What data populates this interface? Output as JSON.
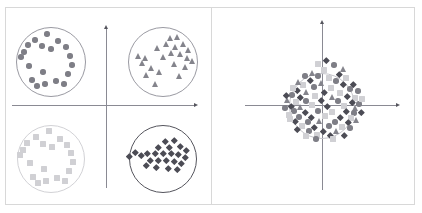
{
  "figure": {
    "title": "",
    "panel_count": 2,
    "background": "#ffffff",
    "frame_color": "#d8d8d8",
    "divider_color": "#d8d8d8",
    "axis_color": "#8a8a93",
    "arrow_color": "#55555d"
  },
  "palette": {
    "circle": "#7e7e86",
    "triangle": "#84848c",
    "square": "#d0d0d4",
    "diamond": "#4c4c55",
    "ring_dark": "#9a9aa2",
    "ring_light": "#d2d2d6"
  },
  "chart_data": {
    "type": "scatter",
    "title": "",
    "xlabel": "",
    "ylabel": "",
    "grid": false,
    "legend": "none",
    "xlim": [
      -1,
      1
    ],
    "ylim": [
      -1,
      1
    ],
    "panels": [
      {
        "name": "separated-clusters",
        "position": "left",
        "axes": {
          "origin_x": 106,
          "origin_y": 105,
          "x_axis_from": 12,
          "x_axis_to": 196,
          "y_axis_from": 188,
          "y_axis_to": 27,
          "x_arrow": "right",
          "y_arrow": "up"
        },
        "clusters": [
          {
            "name": "circles-upper-left",
            "marker": "circle",
            "color": "#7e7e86",
            "ring": {
              "cx": 51,
              "cy": 62,
              "r": 35,
              "color": "#9a9aa2"
            },
            "quadrant": "upper-left",
            "n": 19,
            "points": [
              [
                47,
                34
              ],
              [
                35,
                40
              ],
              [
                58,
                41
              ],
              [
                28,
                45
              ],
              [
                42,
                46
              ],
              [
                24,
                52
              ],
              [
                51,
                49
              ],
              [
                66,
                47
              ],
              [
                21,
                57
              ],
              [
                70,
                56
              ],
              [
                29,
                66
              ],
              [
                72,
                65
              ],
              [
                43,
                72
              ],
              [
                68,
                74
              ],
              [
                32,
                80
              ],
              [
                56,
                81
              ],
              [
                45,
                84
              ],
              [
                64,
                84
              ],
              [
                37,
                86
              ]
            ]
          },
          {
            "name": "triangles-upper-right",
            "marker": "triangle",
            "color": "#84848c",
            "ring": {
              "cx": 163,
              "cy": 62,
              "r": 35,
              "color": "#9a9aa2"
            },
            "quadrant": "upper-right",
            "n": 22,
            "points": [
              [
                171,
                38
              ],
              [
                178,
                37
              ],
              [
                167,
                44
              ],
              [
                184,
                44
              ],
              [
                176,
                47
              ],
              [
                158,
                48
              ],
              [
                189,
                50
              ],
              [
                172,
                53
              ],
              [
                181,
                54
              ],
              [
                139,
                56
              ],
              [
                146,
                58
              ],
              [
                164,
                57
              ],
              [
                188,
                58
              ],
              [
                193,
                61
              ],
              [
                143,
                63
              ],
              [
                175,
                64
              ],
              [
                152,
                68
              ],
              [
                186,
                67
              ],
              [
                160,
                72
              ],
              [
                147,
                75
              ],
              [
                180,
                76
              ],
              [
                156,
                84
              ]
            ]
          },
          {
            "name": "squares-lower-left",
            "marker": "square",
            "color": "#d0d0d4",
            "ring": {
              "cx": 51,
              "cy": 159,
              "r": 34,
              "color": "#d2d2d6"
            },
            "quadrant": "lower-left",
            "n": 19,
            "points": [
              [
                49,
                131
              ],
              [
                36,
                137
              ],
              [
                60,
                139
              ],
              [
                27,
                143
              ],
              [
                43,
                144
              ],
              [
                23,
                150
              ],
              [
                52,
                147
              ],
              [
                67,
                145
              ],
              [
                20,
                155
              ],
              [
                71,
                153
              ],
              [
                30,
                163
              ],
              [
                73,
                162
              ],
              [
                44,
                169
              ],
              [
                69,
                171
              ],
              [
                33,
                177
              ],
              [
                57,
                178
              ],
              [
                46,
                181
              ],
              [
                65,
                181
              ],
              [
                38,
                183
              ]
            ]
          },
          {
            "name": "diamonds-lower-right",
            "marker": "diamond",
            "color": "#4c4c55",
            "ring": {
              "cx": 163,
              "cy": 159,
              "r": 34,
              "color": "#55555d"
            },
            "quadrant": "lower-right",
            "n": 24,
            "points": [
              [
                165,
                141
              ],
              [
                174,
                140
              ],
              [
                158,
                147
              ],
              [
                169,
                147
              ],
              [
                180,
                146
              ],
              [
                186,
                150
              ],
              [
                147,
                153
              ],
              [
                155,
                153
              ],
              [
                163,
                153
              ],
              [
                171,
                153
              ],
              [
                178,
                154
              ],
              [
                185,
                157
              ],
              [
                135,
                152
              ],
              [
                141,
                155
              ],
              [
                129,
                156
              ],
              [
                150,
                160
              ],
              [
                158,
                160
              ],
              [
                166,
                160
              ],
              [
                174,
                161
              ],
              [
                181,
                163
              ],
              [
                146,
                165
              ],
              [
                156,
                167
              ],
              [
                168,
                168
              ],
              [
                177,
                169
              ]
            ]
          }
        ]
      },
      {
        "name": "merged-cluster",
        "position": "right",
        "axes": {
          "origin_x": 322,
          "origin_y": 105,
          "x_axis_from": 245,
          "x_axis_to": 398,
          "y_axis_from": 190,
          "y_axis_to": 22,
          "x_arrow": "right",
          "y_arrow": "up"
        },
        "clusters": [
          {
            "name": "merged-all-shapes",
            "marker": "mixed",
            "ring": {
              "cx": 322,
              "cy": 106,
              "r": 33,
              "color": "#c4c4ca"
            },
            "quadrant": "centered-on-origin",
            "n": 84,
            "points": [
              [
                318,
                76,
                "circle"
              ],
              [
                329,
                78,
                "square"
              ],
              [
                310,
                80,
                "diamond"
              ],
              [
                336,
                81,
                "circle"
              ],
              [
                322,
                83,
                "triangle"
              ],
              [
                303,
                85,
                "square"
              ],
              [
                343,
                84,
                "diamond"
              ],
              [
                314,
                87,
                "circle"
              ],
              [
                331,
                88,
                "square"
              ],
              [
                297,
                90,
                "diamond"
              ],
              [
                350,
                89,
                "circle"
              ],
              [
                307,
                92,
                "triangle"
              ],
              [
                324,
                92,
                "diamond"
              ],
              [
                340,
                93,
                "square"
              ],
              [
                292,
                95,
                "circle"
              ],
              [
                300,
                97,
                "diamond"
              ],
              [
                315,
                96,
                "square"
              ],
              [
                333,
                97,
                "triangle"
              ],
              [
                347,
                96,
                "diamond"
              ],
              [
                355,
                98,
                "square"
              ],
              [
                288,
                100,
                "triangle"
              ],
              [
                296,
                102,
                "square"
              ],
              [
                306,
                101,
                "circle"
              ],
              [
                321,
                100,
                "diamond"
              ],
              [
                338,
                101,
                "circle"
              ],
              [
                352,
                102,
                "diamond"
              ],
              [
                359,
                104,
                "circle"
              ],
              [
                291,
                106,
                "diamond"
              ],
              [
                301,
                107,
                "triangle"
              ],
              [
                312,
                105,
                "square"
              ],
              [
                327,
                106,
                "diamond"
              ],
              [
                344,
                106,
                "square"
              ],
              [
                356,
                108,
                "triangle"
              ],
              [
                294,
                111,
                "circle"
              ],
              [
                305,
                112,
                "diamond"
              ],
              [
                318,
                111,
                "circle"
              ],
              [
                332,
                112,
                "square"
              ],
              [
                346,
                111,
                "diamond"
              ],
              [
                354,
                113,
                "circle"
              ],
              [
                289,
                115,
                "square"
              ],
              [
                299,
                117,
                "circle"
              ],
              [
                311,
                117,
                "diamond"
              ],
              [
                325,
                116,
                "square"
              ],
              [
                340,
                117,
                "diamond"
              ],
              [
                351,
                118,
                "square"
              ],
              [
                295,
                121,
                "diamond"
              ],
              [
                308,
                122,
                "circle"
              ],
              [
                320,
                121,
                "triangle"
              ],
              [
                335,
                122,
                "circle"
              ],
              [
                348,
                122,
                "diamond"
              ],
              [
                302,
                126,
                "square"
              ],
              [
                314,
                127,
                "diamond"
              ],
              [
                329,
                126,
                "circle"
              ],
              [
                342,
                127,
                "square"
              ],
              [
                309,
                131,
                "circle"
              ],
              [
                323,
                131,
                "diamond"
              ],
              [
                337,
                131,
                "triangle"
              ],
              [
                317,
                135,
                "square"
              ],
              [
                330,
                135,
                "diamond"
              ],
              [
                324,
                70,
                "square"
              ],
              [
                313,
                73,
                "triangle"
              ],
              [
                339,
                74,
                "diamond"
              ],
              [
                305,
                76,
                "circle"
              ],
              [
                346,
                78,
                "square"
              ],
              [
                299,
                82,
                "triangle"
              ],
              [
                353,
                84,
                "diamond"
              ],
              [
                293,
                88,
                "square"
              ],
              [
                358,
                91,
                "circle"
              ],
              [
                286,
                95,
                "diamond"
              ],
              [
                362,
                99,
                "square"
              ],
              [
                285,
                108,
                "circle"
              ],
              [
                361,
                112,
                "diamond"
              ],
              [
                290,
                119,
                "square"
              ],
              [
                357,
                120,
                "triangle"
              ],
              [
                297,
                129,
                "diamond"
              ],
              [
                350,
                128,
                "circle"
              ],
              [
                306,
                136,
                "square"
              ],
              [
                344,
                135,
                "diamond"
              ],
              [
                316,
                139,
                "circle"
              ],
              [
                333,
                139,
                "square"
              ],
              [
                326,
                60,
                "diamond"
              ],
              [
                334,
                65,
                "circle"
              ],
              [
                318,
                64,
                "square"
              ],
              [
                344,
                69,
                "triangle"
              ]
            ]
          }
        ]
      }
    ]
  }
}
